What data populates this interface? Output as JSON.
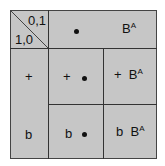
{
  "corner": {
    "top_right": "0,1",
    "bottom_left": "1,0"
  },
  "header_row": {
    "col1": "•",
    "col2_base": "B",
    "col2_sup": "A"
  },
  "rows": [
    {
      "label": "+",
      "cells": [
        {
          "text": "+",
          "dot": true
        },
        {
          "text": "+",
          "base": "B",
          "sup": "A"
        }
      ]
    },
    {
      "label": "b",
      "cells": [
        {
          "text": "b",
          "dot": true
        },
        {
          "text": "b",
          "base": "B",
          "sup": "A"
        }
      ]
    }
  ],
  "colors": {
    "fill": "#c6c6c6",
    "line": "#333333"
  }
}
